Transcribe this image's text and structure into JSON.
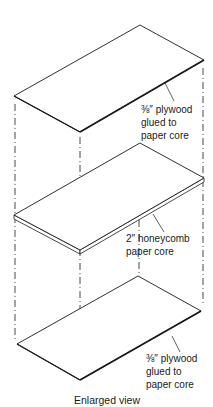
{
  "caption": "Enlarged view",
  "layers": [
    {
      "name": "top-plywood",
      "lines": [
        "⅜″ plywood",
        "glued to",
        "paper core"
      ]
    },
    {
      "name": "honeycomb-core",
      "lines": [
        "2″ honeycomb",
        "paper core"
      ]
    },
    {
      "name": "bottom-plywood",
      "lines": [
        "⅜″ plywood",
        "glued to",
        "paper core"
      ]
    }
  ],
  "colors": {
    "line": "#1a1a1a",
    "background": "#ffffff"
  }
}
